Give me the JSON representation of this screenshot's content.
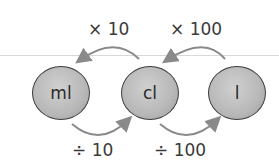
{
  "diagram": {
    "nodes": [
      {
        "label": "ml"
      },
      {
        "label": "cl"
      },
      {
        "label": "l"
      }
    ],
    "top_labels": [
      "× 10",
      "× 100"
    ],
    "bottom_labels": [
      "÷ 10",
      "÷ 100"
    ],
    "colors": {
      "node_fill": "#b8b8b8",
      "node_border": "#3a3a3a",
      "arrow": "#8a8a8a",
      "text": "#3a3a3a"
    }
  }
}
